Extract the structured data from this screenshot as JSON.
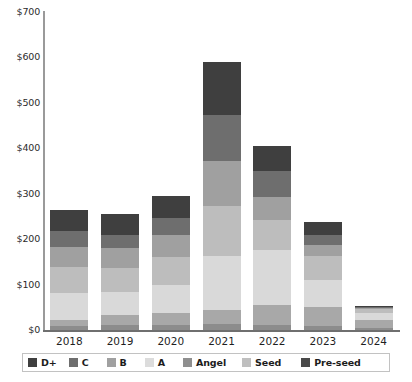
{
  "chart_data": {
    "type": "bar",
    "stacked": true,
    "title": "",
    "xlabel": "",
    "ylabel": "",
    "ylim": [
      0,
      700
    ],
    "ytick_values": [
      0,
      100,
      200,
      300,
      400,
      500,
      600,
      700
    ],
    "ytick_labels": [
      "$0",
      "$100",
      "$200",
      "$300",
      "$400",
      "$500",
      "$600",
      "$700"
    ],
    "grid": false,
    "legend_position": "bottom",
    "categories": [
      "2018",
      "2019",
      "2020",
      "2021",
      "2022",
      "2023",
      "2024"
    ],
    "series": [
      {
        "name": "Pre-seed",
        "color": "#8c8c8c",
        "values": [
          8,
          10,
          12,
          14,
          10,
          8,
          5
        ]
      },
      {
        "name": "Seed",
        "color": "#a8a8a8",
        "values": [
          14,
          22,
          26,
          30,
          46,
          42,
          18
        ]
      },
      {
        "name": "Angel",
        "color": "#d9d9d9",
        "values": [
          60,
          52,
          62,
          118,
          120,
          60,
          14
        ]
      },
      {
        "name": "A",
        "color": "#bdbdbd",
        "values": [
          56,
          52,
          60,
          112,
          66,
          52,
          9
        ]
      },
      {
        "name": "B",
        "color": "#a0a0a0",
        "values": [
          44,
          44,
          50,
          98,
          52,
          26,
          3
        ]
      },
      {
        "name": "C",
        "color": "#6e6e6e",
        "values": [
          36,
          30,
          36,
          102,
          56,
          22,
          2
        ]
      },
      {
        "name": "D+",
        "color": "#3f3f3f",
        "values": [
          47,
          45,
          49,
          116,
          55,
          28,
          1
        ]
      }
    ],
    "totals": [
      265,
      255,
      295,
      590,
      405,
      238,
      52
    ],
    "legend_order": [
      "D+",
      "C",
      "B",
      "A",
      "Angel",
      "Seed",
      "Pre-seed"
    ]
  },
  "legend": {
    "items": [
      {
        "label": "D+",
        "color": "#3f3f3f"
      },
      {
        "label": "C",
        "color": "#6e6e6e"
      },
      {
        "label": "B",
        "color": "#a0a0a0"
      },
      {
        "label": "A",
        "color": "#dcdcdc"
      },
      {
        "label": "Angel",
        "color": "#8f8f8f"
      },
      {
        "label": "Seed",
        "color": "#bfbfbf"
      },
      {
        "label": "Pre-seed",
        "color": "#4a4a4a"
      }
    ]
  },
  "colors": {
    "axis": "#6f6f6f",
    "axis_y": "#9a9a9a",
    "text": "#1f1f1f",
    "legend_border": "#c2c2c2",
    "background": "#ffffff"
  }
}
